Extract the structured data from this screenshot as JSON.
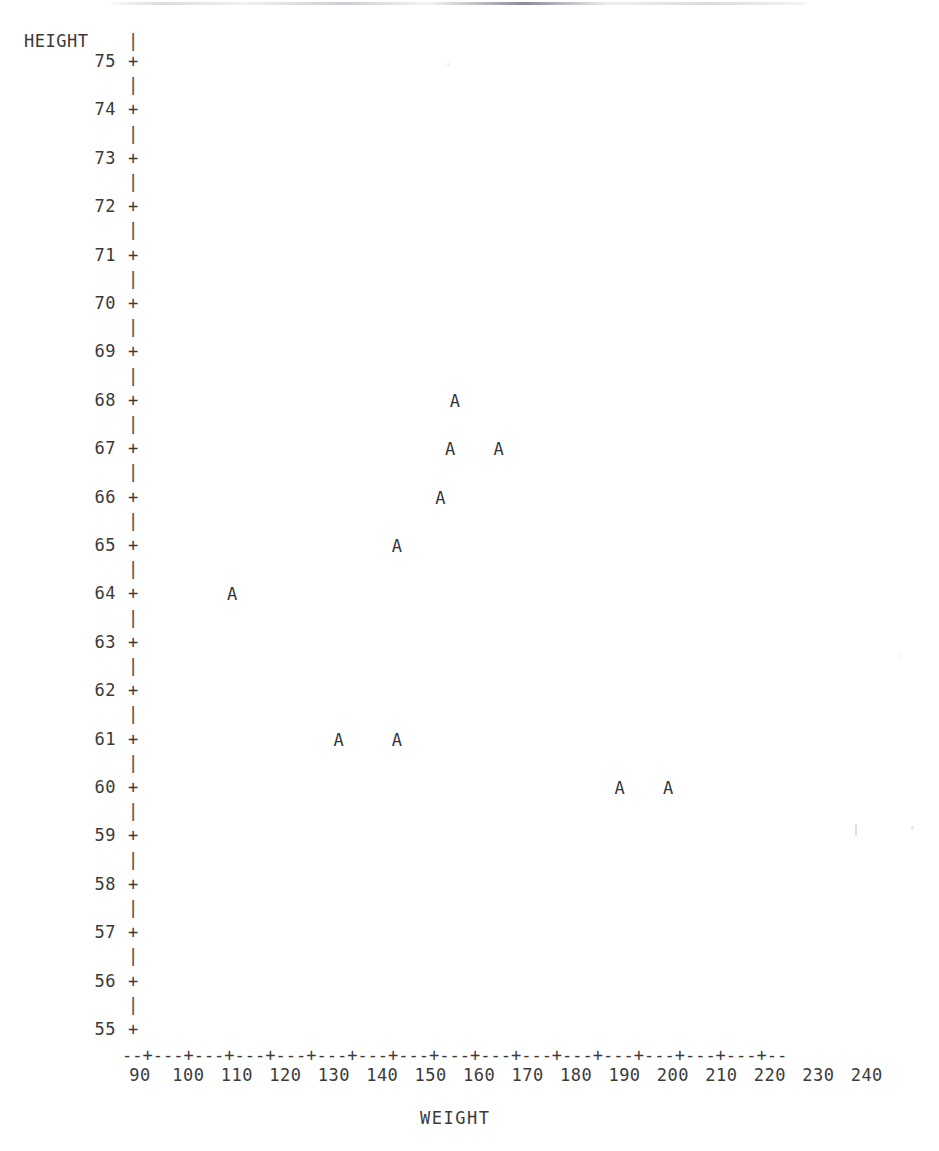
{
  "plot": {
    "title_clipped": "",
    "y_axis": {
      "title": "HEIGHT",
      "ticks": [
        "75",
        "74",
        "73",
        "72",
        "71",
        "70",
        "69",
        "68",
        "67",
        "66",
        "65",
        "64",
        "63",
        "62",
        "61",
        "60",
        "59",
        "58",
        "57",
        "56",
        "55"
      ],
      "tick_symbol": "+",
      "minor_symbol": "|"
    },
    "x_axis": {
      "title": "WEIGHT",
      "ticks": [
        "90",
        "100",
        "110",
        "120",
        "130",
        "140",
        "150",
        "160",
        "170",
        "180",
        "190",
        "200",
        "210",
        "220",
        "230",
        "240"
      ],
      "axis_line": "--+---+---+---+---+---+---+---+---+---+---+---+---+---+---+---+--"
    },
    "marker_symbol": "A",
    "colors": {
      "background": "#ffffff",
      "text": "#3a3a3a",
      "marker": "#33333a",
      "speckle": "#bdbdc4"
    }
  },
  "chart_data": {
    "type": "scatter",
    "title": "",
    "xlabel": "WEIGHT",
    "ylabel": "HEIGHT",
    "xlim": [
      85,
      245
    ],
    "ylim": [
      55,
      75
    ],
    "xticks": [
      90,
      100,
      110,
      120,
      130,
      140,
      150,
      160,
      170,
      180,
      190,
      200,
      210,
      220,
      230,
      240
    ],
    "yticks": [
      55,
      56,
      57,
      58,
      59,
      60,
      61,
      62,
      63,
      64,
      65,
      66,
      67,
      68,
      69,
      70,
      71,
      72,
      73,
      74,
      75
    ],
    "grid": false,
    "legend": false,
    "marker_label": "A",
    "series": [
      {
        "name": "A",
        "points": [
          {
            "x": 155,
            "y": 68
          },
          {
            "x": 154,
            "y": 67
          },
          {
            "x": 164,
            "y": 67
          },
          {
            "x": 152,
            "y": 66
          },
          {
            "x": 143,
            "y": 65
          },
          {
            "x": 109,
            "y": 64
          },
          {
            "x": 131,
            "y": 61
          },
          {
            "x": 143,
            "y": 61
          },
          {
            "x": 189,
            "y": 60
          },
          {
            "x": 199,
            "y": 60
          }
        ]
      }
    ]
  }
}
